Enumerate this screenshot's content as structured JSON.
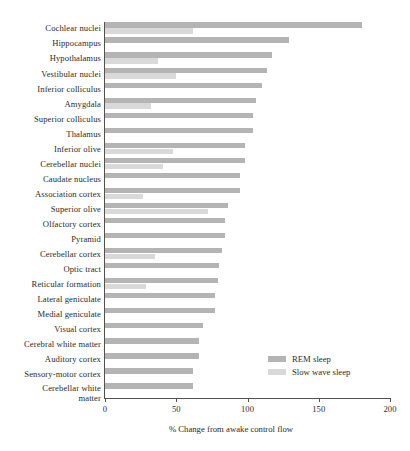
{
  "chart_data": {
    "type": "bar",
    "orientation": "horizontal",
    "title": "",
    "xlabel": "% Change from awake control flow",
    "ylabel": "",
    "xlim": [
      0,
      200
    ],
    "xticks": [
      0,
      50,
      100,
      150,
      200
    ],
    "grid": false,
    "legend_position": "inside-lower-right",
    "categories": [
      "Cochlear nuclei",
      "Hippocampus",
      "Hypothalamus",
      "Vestibular nuclei",
      "Inferior colliculus",
      "Amygdala",
      "Superior colliculus",
      "Thalamus",
      "Inferior olive",
      "Cerebellar nuclei",
      "Caudate nucleus",
      "Association cortex",
      "Superior olive",
      "Olfactory cortex",
      "Pyramid",
      "Cerebellar cortex",
      "Optic tract",
      "Reticular formation",
      "Lateral geniculate",
      "Medial geniculate",
      "Visual cortex",
      "Cerebral white matter",
      "Auditory cortex",
      "Sensory-motor cortex",
      "Cerebellar white\nmatter"
    ],
    "series": [
      {
        "name": "REM sleep",
        "color": "#b4b4b4",
        "values": [
          180,
          129,
          117,
          114,
          110,
          106,
          104,
          104,
          98,
          98,
          95,
          95,
          86,
          84,
          84,
          82,
          80,
          79,
          77,
          77,
          69,
          66,
          66,
          62,
          62
        ]
      },
      {
        "name": "Slow wave sleep",
        "color": "#d9d9d9",
        "values": [
          62,
          0,
          37,
          50,
          0,
          32,
          0,
          0,
          48,
          41,
          0,
          27,
          72,
          0,
          0,
          35,
          0,
          29,
          0,
          0,
          0,
          0,
          0,
          0,
          0
        ]
      }
    ]
  },
  "legend": {
    "items": [
      {
        "label": "REM sleep",
        "color": "#b4b4b4"
      },
      {
        "label": "Slow wave sleep",
        "color": "#d9d9d9"
      }
    ]
  }
}
